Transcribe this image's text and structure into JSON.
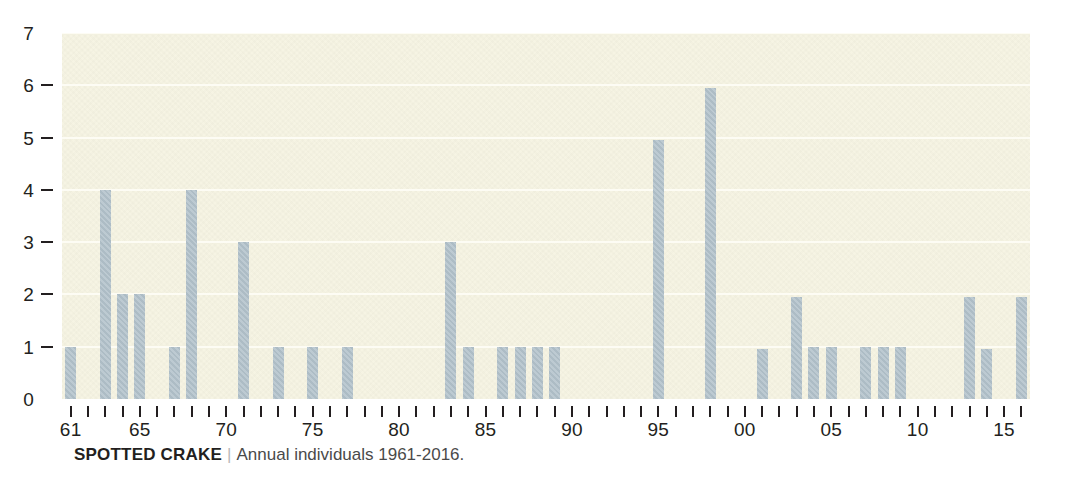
{
  "caption": {
    "title": "SPOTTED CRAKE",
    "separator": "|",
    "text": "Annual individuals 1961-2016."
  },
  "colors": {
    "bar": "#b0c0c9",
    "plot_background": "#f6f4e3",
    "gridline": "#fdfcf4",
    "axis_text": "#231f20",
    "caption_text": "#4a4a4a"
  },
  "chart_data": {
    "type": "bar",
    "title": "SPOTTED CRAKE",
    "subtitle": "Annual individuals 1961-2016.",
    "xlabel": "",
    "ylabel": "",
    "ylim": [
      0,
      7
    ],
    "yticks": [
      0,
      1,
      2,
      3,
      4,
      5,
      6,
      7
    ],
    "ytick_labels": [
      "0",
      "1",
      "2",
      "3",
      "4",
      "5",
      "6",
      "7"
    ],
    "grid": true,
    "legend": "none",
    "xtick_labels": [
      "61",
      "65",
      "70",
      "75",
      "80",
      "85",
      "90",
      "95",
      "00",
      "05",
      "10",
      "15"
    ],
    "xtick_label_years": [
      1961,
      1965,
      1970,
      1975,
      1980,
      1985,
      1990,
      1995,
      2000,
      2005,
      2010,
      2015
    ],
    "categories": [
      1961,
      1962,
      1963,
      1964,
      1965,
      1966,
      1967,
      1968,
      1969,
      1970,
      1971,
      1972,
      1973,
      1974,
      1975,
      1976,
      1977,
      1978,
      1979,
      1980,
      1981,
      1982,
      1983,
      1984,
      1985,
      1986,
      1987,
      1988,
      1989,
      1990,
      1991,
      1992,
      1993,
      1994,
      1995,
      1996,
      1997,
      1998,
      1999,
      2000,
      2001,
      2002,
      2003,
      2004,
      2005,
      2006,
      2007,
      2008,
      2009,
      2010,
      2011,
      2012,
      2013,
      2014,
      2015,
      2016
    ],
    "values": [
      1,
      0,
      4,
      2,
      2,
      0,
      1,
      4,
      0,
      0,
      3,
      0,
      1,
      0,
      1,
      0,
      1,
      0,
      0,
      0,
      0,
      0,
      3,
      1,
      0,
      1,
      1,
      1,
      1,
      0,
      0,
      0,
      0,
      0,
      4.95,
      0,
      0,
      5.95,
      0,
      0,
      0.95,
      0,
      1.95,
      1,
      1,
      0,
      1,
      1,
      1,
      0,
      0,
      0,
      1.95,
      0.95,
      0,
      1.95
    ]
  }
}
